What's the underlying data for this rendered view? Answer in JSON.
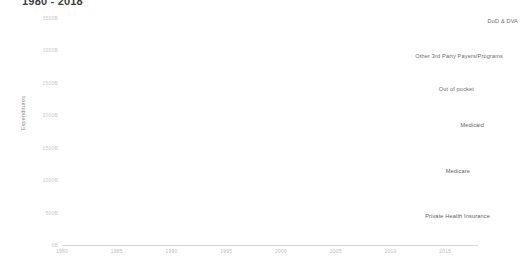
{
  "chart_data": {
    "type": "area",
    "stacked": true,
    "title": "1980 - 2018",
    "title_full": "1980 - 2018",
    "xlabel": "",
    "ylabel": "Expenditures",
    "xlim": [
      1980,
      2018
    ],
    "ylim": [
      0,
      3500
    ],
    "y_unit": "B",
    "grid": false,
    "legend_position": "inline-annotations",
    "yticks": [
      0,
      500,
      1000,
      1500,
      2000,
      2500,
      3000,
      3500
    ],
    "ytick_labels": [
      "0B",
      "500B",
      "1000B",
      "1500B",
      "2000B",
      "2500B",
      "3000B",
      "3500B"
    ],
    "xticks": [
      1980,
      1985,
      1990,
      1995,
      2000,
      2005,
      2010,
      2015
    ],
    "xtick_labels": [
      "1980",
      "1985",
      "1990",
      "1995",
      "2000",
      "2005",
      "2010",
      "2015"
    ],
    "x": [
      1980,
      1985,
      1990,
      1995,
      2000,
      2005,
      2010,
      2015,
      2018
    ],
    "series": [
      {
        "name": "Private Health Insurance",
        "color": "#a8a8a8",
        "values": [
          62,
          132,
          236,
          326,
          449,
          692,
          853,
          1066,
          1243
        ]
      },
      {
        "name": "Medicare",
        "color": "#b8b8b8",
        "values": [
          37,
          71,
          111,
          184,
          224,
          339,
          519,
          644,
          750
        ]
      },
      {
        "name": "Medicaid",
        "color": "#c6c6c6",
        "values": [
          26,
          41,
          75,
          159,
          201,
          310,
          397,
          545,
          597
        ]
      },
      {
        "name": "Out of pocket",
        "color": "#d6d6d6",
        "values": [
          59,
          95,
          138,
          161,
          200,
          263,
          302,
          339,
          375
        ]
      },
      {
        "name": "Other 3rd Party Payers/Programs",
        "color": "#e6e6e6",
        "values": [
          22,
          38,
          64,
          94,
          125,
          172,
          220,
          266,
          290
        ]
      },
      {
        "name": "DoD & DVA",
        "color": "#f2f2f2",
        "values": [
          7,
          13,
          20,
          28,
          38,
          61,
          92,
          112,
          126
        ]
      }
    ]
  },
  "annotations": [
    {
      "key": "dod",
      "label": "DoD & DVA"
    },
    {
      "key": "other",
      "label": "Other 3rd Party Payers/Programs"
    },
    {
      "key": "oop",
      "label": "Out of pocket"
    },
    {
      "key": "medicaid",
      "label": "Medicaid"
    },
    {
      "key": "medicare",
      "label": "Medicare"
    },
    {
      "key": "private",
      "label": "Private Health Insurance"
    }
  ],
  "axis": {
    "y_title": "Expenditures"
  }
}
